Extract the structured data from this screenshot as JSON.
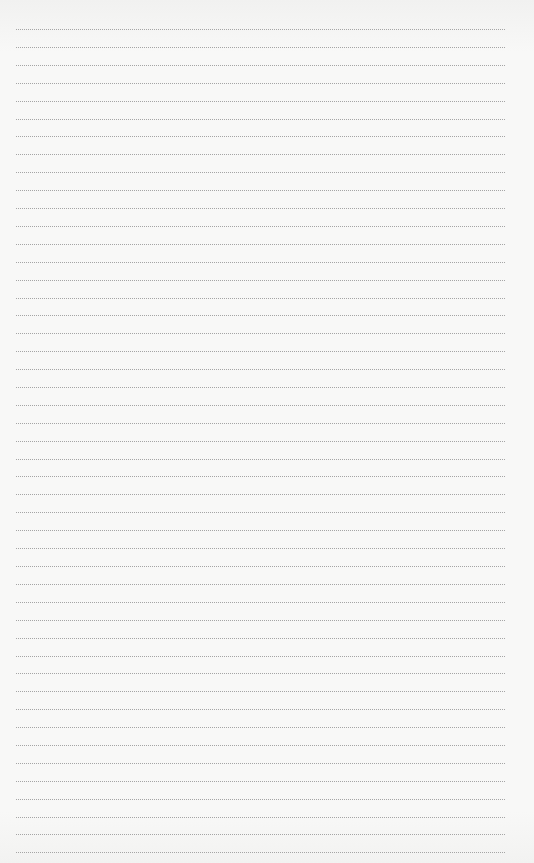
{
  "page": {
    "type": "lined-paper",
    "line_style": "dotted",
    "line_count": 47,
    "first_line_y": 29,
    "line_spacing": 17.9,
    "line_left": 16,
    "line_width": 489,
    "colors": {
      "background": "#f6f6f5",
      "line": "#a5a5a5"
    }
  }
}
